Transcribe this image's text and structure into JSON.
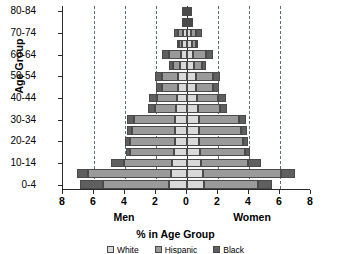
{
  "chart_data": {
    "type": "bar",
    "subtype": "population-pyramid-stacked",
    "title": "",
    "xlabel": "% in Age Group",
    "ylabel": "Age Group",
    "side_labels": {
      "left": "Men",
      "right": "Women"
    },
    "xlim": [
      -8,
      8
    ],
    "x_ticks": [
      8,
      6,
      4,
      2,
      0,
      2,
      4,
      6,
      8
    ],
    "x_tick_values": [
      -8,
      -6,
      -4,
      -2,
      0,
      2,
      4,
      6,
      8
    ],
    "gridlines": [
      -6,
      -4,
      -2,
      2,
      4,
      6
    ],
    "grid": true,
    "grid_style": "dashed",
    "legend_position": "bottom",
    "legend": [
      {
        "label": "White",
        "color": "#d9d9d9"
      },
      {
        "label": "Hispanic",
        "color": "#9a9a9a"
      },
      {
        "label": "Black",
        "color": "#5f5f5f"
      }
    ],
    "categories": [
      "0-4",
      "5-9",
      "10-14",
      "15-19",
      "20-24",
      "25-29",
      "30-34",
      "35-39",
      "40-44",
      "45-49",
      "50-54",
      "55-59",
      "60-64",
      "65-69",
      "70-74",
      "75-79",
      "80-84"
    ],
    "axis_tick_labels": [
      "0-4",
      "10-14",
      "20-24",
      "30-34",
      "40-44",
      "50-54",
      "60-64",
      "70-74",
      "80-84"
    ],
    "series": [
      {
        "name": "White",
        "side": "Men",
        "values": [
          1.15,
          1.05,
          0.95,
          0.85,
          0.8,
          0.8,
          0.8,
          0.7,
          0.65,
          0.6,
          0.55,
          0.45,
          0.4,
          0.3,
          0.25,
          0.15,
          0.1
        ]
      },
      {
        "name": "Hispanic",
        "side": "Men",
        "values": [
          4.25,
          5.35,
          3.1,
          2.85,
          2.9,
          2.75,
          2.65,
          1.35,
          1.3,
          1.0,
          1.05,
          0.45,
          0.75,
          0.2,
          0.3,
          0.1,
          0.1
        ]
      },
      {
        "name": "Black",
        "side": "Men",
        "values": [
          1.5,
          0.7,
          0.85,
          0.25,
          0.3,
          0.3,
          0.4,
          0.45,
          0.5,
          0.4,
          0.45,
          0.25,
          0.45,
          0.15,
          0.3,
          0.1,
          0.15
        ]
      },
      {
        "name": "White",
        "side": "Women",
        "values": [
          1.1,
          1.0,
          0.9,
          0.85,
          0.8,
          0.8,
          0.8,
          0.7,
          0.65,
          0.6,
          0.55,
          0.45,
          0.4,
          0.3,
          0.25,
          0.15,
          0.1
        ]
      },
      {
        "name": "Hispanic",
        "side": "Women",
        "values": [
          3.45,
          5.05,
          3.05,
          2.9,
          2.8,
          2.7,
          2.55,
          1.4,
          1.35,
          1.05,
          1.1,
          0.5,
          0.8,
          0.25,
          0.35,
          0.1,
          0.1
        ]
      },
      {
        "name": "Black",
        "side": "Women",
        "values": [
          0.95,
          0.95,
          0.8,
          0.3,
          0.35,
          0.35,
          0.45,
          0.45,
          0.5,
          0.4,
          0.5,
          0.25,
          0.45,
          0.15,
          0.35,
          0.1,
          0.15
        ]
      }
    ]
  }
}
